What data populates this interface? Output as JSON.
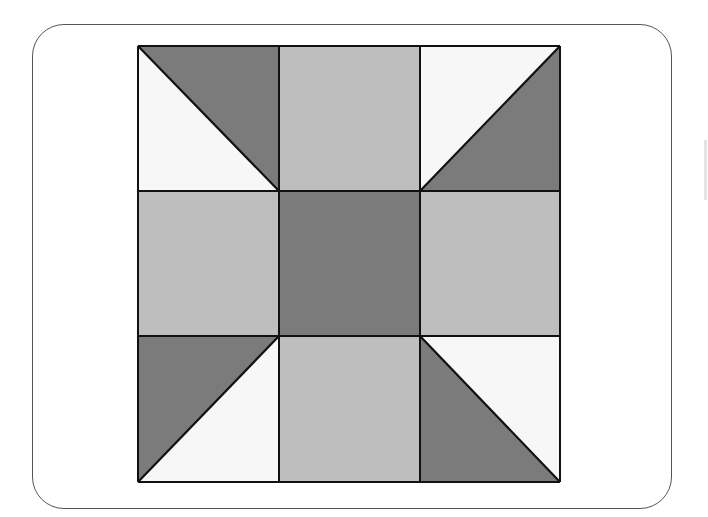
{
  "diagram": {
    "type": "quilt-block",
    "grid": {
      "rows": 3,
      "cols": 3
    },
    "colors": {
      "dark": "#7b7b7b",
      "light": "#bebebe",
      "white": "#f7f7f7",
      "line": "#111111",
      "frame": "#555555"
    },
    "cells": [
      {
        "row": 0,
        "col": 0,
        "kind": "half-triangle",
        "diagonal": "tl-br",
        "dark_side": "upper-right"
      },
      {
        "row": 0,
        "col": 1,
        "kind": "solid",
        "fill": "light"
      },
      {
        "row": 0,
        "col": 2,
        "kind": "half-triangle",
        "diagonal": "tr-bl",
        "dark_side": "lower-right"
      },
      {
        "row": 1,
        "col": 0,
        "kind": "solid",
        "fill": "light"
      },
      {
        "row": 1,
        "col": 1,
        "kind": "solid",
        "fill": "dark"
      },
      {
        "row": 1,
        "col": 2,
        "kind": "solid",
        "fill": "light"
      },
      {
        "row": 2,
        "col": 0,
        "kind": "half-triangle",
        "diagonal": "tr-bl",
        "dark_side": "upper-left"
      },
      {
        "row": 2,
        "col": 1,
        "kind": "solid",
        "fill": "light"
      },
      {
        "row": 2,
        "col": 2,
        "kind": "half-triangle",
        "diagonal": "tl-br",
        "dark_side": "lower-left"
      }
    ]
  }
}
